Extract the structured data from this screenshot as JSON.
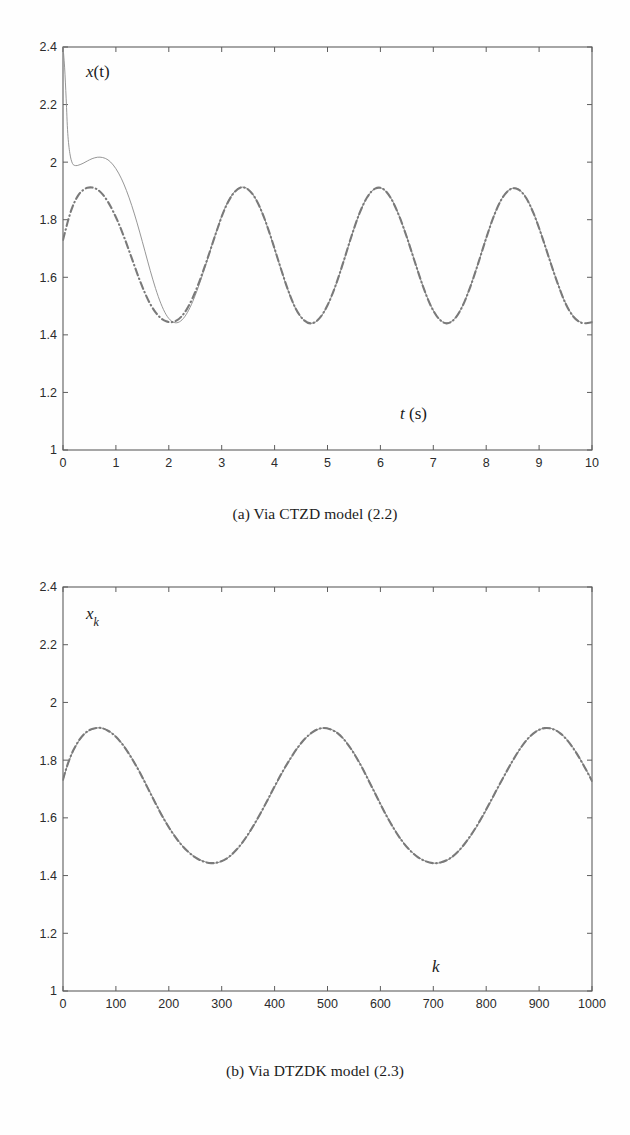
{
  "figure": {
    "panels": [
      {
        "id": "panel-a",
        "caption": "(a) Via CTZD model (2.2)",
        "ylabel_main": "x",
        "ylabel_arg": "(t)",
        "xlabel_sym": "t",
        "xlabel_unit": "(s)"
      },
      {
        "id": "panel-b",
        "caption": "(b) Via DTZDK model (2.3)",
        "ylabel_main": "x",
        "ylabel_sub": "k",
        "xlabel_sym": "k",
        "xlabel_unit": ""
      }
    ]
  },
  "chart_data": [
    {
      "type": "line",
      "id": "panel-a",
      "title": "(a) Via CTZD model (2.2)",
      "xlabel": "t (s)",
      "ylabel": "x(t)",
      "xlim": [
        0,
        10
      ],
      "ylim": [
        1,
        2.4
      ],
      "xticks": [
        0,
        1,
        2,
        3,
        4,
        5,
        6,
        7,
        8,
        9,
        10
      ],
      "yticks": [
        1,
        1.2,
        1.4,
        1.6,
        1.8,
        2,
        2.2,
        2.4
      ],
      "xticklabels": [
        "0",
        "1",
        "2",
        "3",
        "4",
        "5",
        "6",
        "7",
        "8",
        "9",
        "10"
      ],
      "yticklabels": [
        "1",
        "1.2",
        "1.4",
        "1.6",
        "1.8",
        "2",
        "2.2",
        "2.4"
      ],
      "grid": false,
      "legend": null,
      "box": true,
      "series": [
        {
          "name": "solid-trajectory",
          "style": "solid",
          "color": "#8a8a8a",
          "width": 0.9,
          "x": [
            0,
            0.03,
            0.06,
            0.09,
            0.13,
            0.18,
            0.24,
            0.3,
            0.38,
            0.46,
            0.55,
            0.65,
            0.75,
            0.85,
            0.95,
            1.05,
            1.15,
            1.25,
            1.35,
            1.45,
            1.55,
            1.65,
            1.75,
            1.85,
            1.95,
            2.05,
            2.15,
            2.25,
            2.35,
            2.45,
            2.55,
            2.65,
            2.75,
            2.9,
            3.05,
            3.2,
            3.35,
            3.5,
            3.65,
            3.8,
            3.95,
            4.1,
            4.25,
            4.4,
            4.55,
            4.7,
            4.85,
            5,
            5.15,
            5.3,
            5.45,
            5.6,
            5.75,
            5.9,
            6.05,
            6.2,
            6.35,
            6.5,
            6.65,
            6.8,
            6.95,
            7.1,
            7.25,
            7.4,
            7.55,
            7.7,
            7.85,
            8,
            8.15,
            8.3,
            8.45,
            8.6,
            8.75,
            8.9,
            9.05,
            9.2,
            9.35,
            9.5,
            9.65,
            9.8,
            9.95,
            10
          ],
          "y": [
            2.4,
            2.33,
            2.22,
            2.1,
            2.03,
            1.995,
            1.988,
            1.99,
            1.996,
            2.004,
            2.012,
            2.017,
            2.016,
            2.008,
            1.99,
            1.962,
            1.924,
            1.876,
            1.82,
            1.757,
            1.69,
            1.623,
            1.561,
            1.509,
            1.47,
            1.448,
            1.442,
            1.452,
            1.477,
            1.515,
            1.562,
            1.616,
            1.673,
            1.76,
            1.836,
            1.888,
            1.912,
            1.906,
            1.87,
            1.808,
            1.727,
            1.64,
            1.557,
            1.49,
            1.452,
            1.44,
            1.457,
            1.502,
            1.569,
            1.652,
            1.74,
            1.82,
            1.878,
            1.908,
            1.907,
            1.875,
            1.816,
            1.74,
            1.655,
            1.572,
            1.503,
            1.458,
            1.441,
            1.456,
            1.5,
            1.568,
            1.65,
            1.737,
            1.816,
            1.875,
            1.906,
            1.907,
            1.878,
            1.821,
            1.745,
            1.661,
            1.58,
            1.51,
            1.464,
            1.443,
            1.443
          ]
        },
        {
          "name": "dashdot-trajectory",
          "style": "dashdot",
          "color": "#7a7a7a",
          "width": 2.1,
          "x": [
            0,
            0.05,
            0.1,
            0.16,
            0.22,
            0.3,
            0.38,
            0.46,
            0.55,
            0.65,
            0.75,
            0.85,
            0.95,
            1.05,
            1.15,
            1.25,
            1.35,
            1.45,
            1.55,
            1.65,
            1.75,
            1.85,
            1.95,
            2.05,
            2.15,
            2.25,
            2.35,
            2.45,
            2.55,
            2.65,
            2.75,
            2.9,
            3.05,
            3.2,
            3.35,
            3.5,
            3.65,
            3.8,
            3.95,
            4.1,
            4.25,
            4.4,
            4.55,
            4.7,
            4.85,
            5,
            5.15,
            5.3,
            5.45,
            5.6,
            5.75,
            5.9,
            6.05,
            6.2,
            6.35,
            6.5,
            6.65,
            6.8,
            6.95,
            7.1,
            7.25,
            7.4,
            7.55,
            7.7,
            7.85,
            8,
            8.15,
            8.3,
            8.45,
            8.6,
            8.75,
            8.9,
            9.05,
            9.2,
            9.35,
            9.5,
            9.65,
            9.8,
            9.95,
            10
          ],
          "y": [
            1.73,
            1.765,
            1.8,
            1.835,
            1.862,
            1.888,
            1.903,
            1.911,
            1.912,
            1.905,
            1.888,
            1.862,
            1.828,
            1.788,
            1.742,
            1.692,
            1.64,
            1.59,
            1.545,
            1.507,
            1.478,
            1.458,
            1.447,
            1.444,
            1.45,
            1.466,
            1.492,
            1.528,
            1.572,
            1.622,
            1.675,
            1.758,
            1.834,
            1.886,
            1.911,
            1.905,
            1.87,
            1.808,
            1.728,
            1.641,
            1.558,
            1.491,
            1.452,
            1.44,
            1.458,
            1.503,
            1.57,
            1.653,
            1.741,
            1.82,
            1.878,
            1.908,
            1.907,
            1.874,
            1.815,
            1.739,
            1.654,
            1.571,
            1.502,
            1.457,
            1.44,
            1.455,
            1.499,
            1.567,
            1.649,
            1.736,
            1.815,
            1.874,
            1.905,
            1.906,
            1.877,
            1.82,
            1.744,
            1.66,
            1.579,
            1.509,
            1.463,
            1.442,
            1.442,
            1.444
          ]
        }
      ]
    },
    {
      "type": "line",
      "id": "panel-b",
      "title": "(b) Via DTZDK model (2.3)",
      "xlabel": "k",
      "ylabel": "x_k",
      "xlim": [
        0,
        1000
      ],
      "ylim": [
        1,
        2.4
      ],
      "xticks": [
        0,
        100,
        200,
        300,
        400,
        500,
        600,
        700,
        800,
        900,
        1000
      ],
      "yticks": [
        1,
        1.2,
        1.4,
        1.6,
        1.8,
        2,
        2.2,
        2.4
      ],
      "xticklabels": [
        "0",
        "100",
        "200",
        "300",
        "400",
        "500",
        "600",
        "700",
        "800",
        "900",
        "1000"
      ],
      "yticklabels": [
        "1",
        "1.2",
        "1.4",
        "1.6",
        "1.8",
        "2",
        "2.2",
        "2.4"
      ],
      "grid": false,
      "legend": null,
      "box": true,
      "series": [
        {
          "name": "solid-trajectory",
          "style": "solid",
          "color": "#8a8a8a",
          "width": 0.9,
          "x": [
            0,
            5,
            12,
            20,
            30,
            42,
            55,
            70,
            85,
            100,
            115,
            130,
            145,
            160,
            175,
            190,
            205,
            220,
            235,
            250,
            265,
            280,
            295,
            310,
            325,
            340,
            355,
            370,
            385,
            400,
            415,
            430,
            445,
            460,
            475,
            490,
            505,
            520,
            535,
            550,
            565,
            580,
            595,
            610,
            625,
            640,
            655,
            670,
            685,
            700,
            715,
            730,
            745,
            760,
            775,
            790,
            805,
            820,
            835,
            850,
            865,
            880,
            895,
            910,
            925,
            940,
            955,
            970,
            985,
            1000
          ],
          "y": [
            1.73,
            1.762,
            1.8,
            1.834,
            1.866,
            1.893,
            1.907,
            1.912,
            1.903,
            1.882,
            1.85,
            1.808,
            1.76,
            1.706,
            1.652,
            1.6,
            1.555,
            1.516,
            1.486,
            1.464,
            1.45,
            1.443,
            1.446,
            1.459,
            1.482,
            1.515,
            1.556,
            1.603,
            1.654,
            1.707,
            1.758,
            1.805,
            1.846,
            1.878,
            1.9,
            1.911,
            1.908,
            1.893,
            1.864,
            1.825,
            1.777,
            1.723,
            1.668,
            1.614,
            1.565,
            1.523,
            1.49,
            1.466,
            1.45,
            1.443,
            1.445,
            1.457,
            1.479,
            1.51,
            1.549,
            1.594,
            1.644,
            1.696,
            1.748,
            1.797,
            1.841,
            1.876,
            1.9,
            1.911,
            1.909,
            1.894,
            1.866,
            1.828,
            1.781,
            1.73
          ]
        },
        {
          "name": "dashdot-trajectory",
          "style": "dashdot",
          "color": "#7a7a7a",
          "width": 2.1,
          "x": [
            0,
            5,
            12,
            20,
            30,
            42,
            55,
            70,
            85,
            100,
            115,
            130,
            145,
            160,
            175,
            190,
            205,
            220,
            235,
            250,
            265,
            280,
            295,
            310,
            325,
            340,
            355,
            370,
            385,
            400,
            415,
            430,
            445,
            460,
            475,
            490,
            505,
            520,
            535,
            550,
            565,
            580,
            595,
            610,
            625,
            640,
            655,
            670,
            685,
            700,
            715,
            730,
            745,
            760,
            775,
            790,
            805,
            820,
            835,
            850,
            865,
            880,
            895,
            910,
            925,
            940,
            955,
            970,
            985,
            1000
          ],
          "y": [
            1.732,
            1.764,
            1.802,
            1.836,
            1.868,
            1.894,
            1.908,
            1.912,
            1.902,
            1.881,
            1.848,
            1.806,
            1.758,
            1.704,
            1.65,
            1.598,
            1.553,
            1.515,
            1.485,
            1.463,
            1.449,
            1.443,
            1.447,
            1.46,
            1.484,
            1.517,
            1.558,
            1.605,
            1.656,
            1.709,
            1.76,
            1.806,
            1.847,
            1.879,
            1.901,
            1.911,
            1.907,
            1.892,
            1.863,
            1.823,
            1.775,
            1.721,
            1.666,
            1.612,
            1.564,
            1.522,
            1.489,
            1.465,
            1.45,
            1.443,
            1.446,
            1.458,
            1.48,
            1.512,
            1.551,
            1.596,
            1.646,
            1.698,
            1.749,
            1.798,
            1.842,
            1.877,
            1.9,
            1.911,
            1.908,
            1.893,
            1.865,
            1.826,
            1.779,
            1.728
          ]
        }
      ]
    }
  ]
}
